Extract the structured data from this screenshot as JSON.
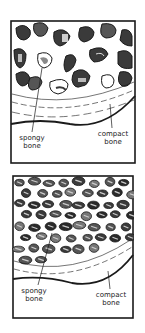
{
  "panels": [
    {
      "id": "normal-bone",
      "labels": {
        "spongy": [
          "spongy",
          "bone"
        ],
        "compact": [
          "compact",
          "bone"
        ]
      }
    },
    {
      "id": "dense-bone",
      "labels": {
        "spongy": [
          "spongy",
          "bone"
        ],
        "compact": [
          "compact",
          "bone"
        ]
      }
    }
  ],
  "colors": {
    "ink": "#1a1a1a",
    "dark_fill": "#3a3a3a",
    "mid_fill": "#8a8a8a",
    "light_fill": "#d8d8d8",
    "background": "#ffffff"
  }
}
